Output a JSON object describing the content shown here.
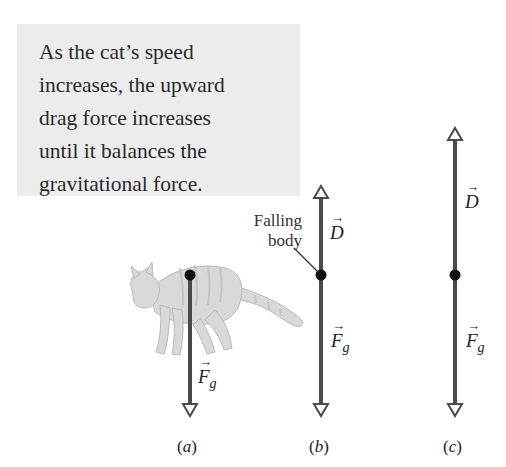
{
  "callout": {
    "lines": [
      "As the cat’s speed",
      "increases, the upward",
      "drag force increases",
      "until it balances the",
      "gravitational force."
    ]
  },
  "annotation": {
    "line1": "Falling",
    "line2": "body"
  },
  "vectors": {
    "drag_symbol": "D",
    "gravity_symbol": "F",
    "gravity_subscript": "g",
    "arrow_glyph": "→"
  },
  "panels": [
    {
      "label_open": "(",
      "letter": "a",
      "label_close": ")",
      "has_drag": false,
      "drag_length": 0
    },
    {
      "label_open": "(",
      "letter": "b",
      "label_close": ")",
      "has_drag": true,
      "drag_length": "short"
    },
    {
      "label_open": "(",
      "letter": "c",
      "label_close": ")",
      "has_drag": true,
      "drag_length": "equal"
    }
  ],
  "colors": {
    "callout_bg": "#ececec",
    "vector_line": "#4a4a4a",
    "dot": "#111111",
    "text": "#2a2a2a"
  }
}
